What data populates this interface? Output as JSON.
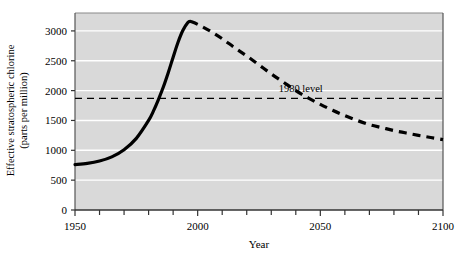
{
  "chart_data": {
    "type": "line",
    "title": "",
    "xlabel": "Year",
    "ylabel_line1": "Effective stratospheric chlorine",
    "ylabel_line2": "(parts per million)",
    "xlim": [
      1950,
      2100
    ],
    "ylim": [
      0,
      3300
    ],
    "grid": "horizontal-white-gridlines",
    "plot_background": "#d9d9d9",
    "legend": "none",
    "x_ticks_major": [
      1950,
      2000,
      2050,
      2100
    ],
    "x_ticks_major_labels": [
      "1950",
      "2000",
      "2050",
      "2100"
    ],
    "x_ticks_minor_step": 10,
    "y_ticks": [
      0,
      500,
      1000,
      1500,
      2000,
      2500,
      3000
    ],
    "y_ticks_labels": [
      "0",
      "500",
      "1000",
      "1500",
      "2000",
      "2500",
      "3000"
    ],
    "annotations": [
      {
        "name": "1980-level-line",
        "label": "1980 level",
        "value": 1870,
        "style": "dashed-horizontal",
        "label_x": 2042,
        "color": "#000000"
      }
    ],
    "series": [
      {
        "name": "Observed effective stratospheric chlorine",
        "style": "solid",
        "color": "#000000",
        "x": [
          1950,
          1955,
          1960,
          1965,
          1970,
          1975,
          1980,
          1982,
          1984,
          1986,
          1988,
          1990,
          1992,
          1994,
          1996,
          1997
        ],
        "values": [
          760,
          780,
          820,
          890,
          1010,
          1200,
          1500,
          1660,
          1850,
          2060,
          2300,
          2560,
          2810,
          3010,
          3140,
          3160
        ]
      },
      {
        "name": "Projected effective stratospheric chlorine",
        "style": "dashed",
        "color": "#000000",
        "x": [
          1997,
          2000,
          2005,
          2010,
          2015,
          2020,
          2025,
          2030,
          2035,
          2040,
          2045,
          2050,
          2055,
          2060,
          2065,
          2070,
          2075,
          2080,
          2085,
          2090,
          2095,
          2100
        ],
        "values": [
          3160,
          3110,
          3000,
          2870,
          2720,
          2580,
          2430,
          2280,
          2140,
          2000,
          1880,
          1770,
          1670,
          1580,
          1500,
          1430,
          1380,
          1330,
          1290,
          1250,
          1215,
          1180
        ]
      }
    ]
  },
  "axes": {
    "x_title": "Year",
    "y_title_line1": "Effective stratospheric chlorine",
    "y_title_line2": "(parts per million)"
  }
}
